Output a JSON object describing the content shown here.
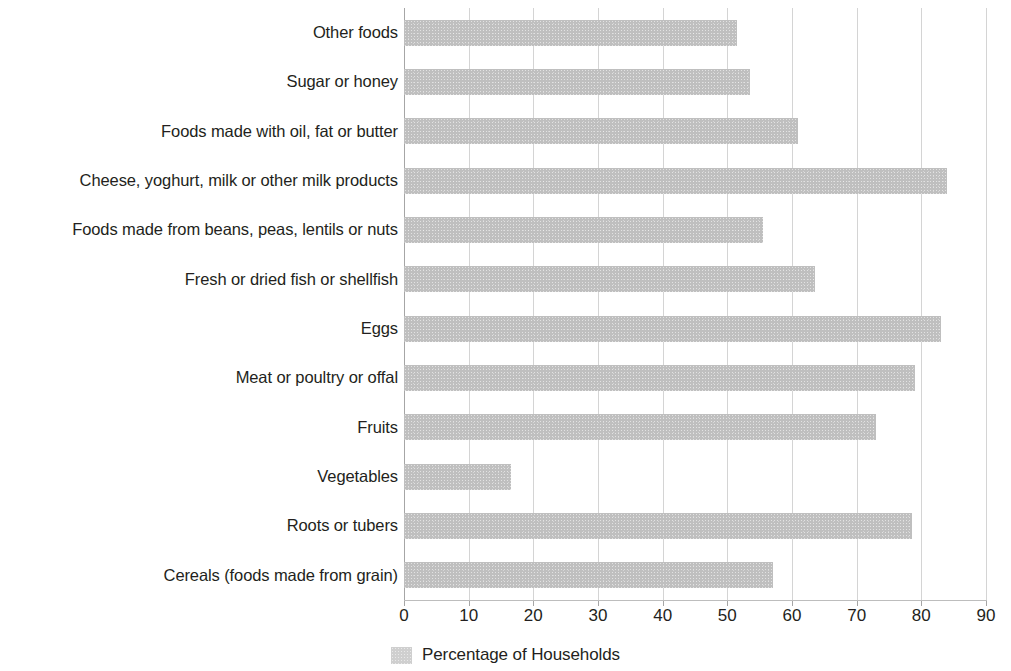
{
  "chart_data": {
    "type": "bar",
    "orientation": "horizontal",
    "title": "",
    "subtitle": "",
    "xlabel": "",
    "ylabel": "",
    "xlim": [
      0,
      90
    ],
    "xticks": [
      0,
      10,
      20,
      30,
      40,
      50,
      60,
      70,
      80,
      90
    ],
    "xtick_labels": [
      "0",
      "10",
      "20",
      "30",
      "40",
      "50",
      "60",
      "70",
      "80",
      "90"
    ],
    "grid": "vertical",
    "legend_position": "bottom-center",
    "legend": [
      "Percentage of Households"
    ],
    "series_name": "Percentage of Households",
    "bar_color": "#bfbfbf",
    "categories": [
      "Other foods",
      "Sugar or honey",
      "Foods made with oil, fat or butter",
      "Cheese, yoghurt, milk or other milk products",
      "Foods made from beans, peas, lentils or nuts",
      "Fresh or dried fish or shellfish",
      "Eggs",
      "Meat or poultry or offal",
      "Fruits",
      "Vegetables",
      "Roots or tubers",
      "Cereals (foods made from grain)"
    ],
    "values": [
      51.5,
      53.5,
      61,
      84,
      55.5,
      63.5,
      83,
      79,
      73,
      16.5,
      78.5,
      57
    ]
  },
  "legend": {
    "swatch_icon": "legend-swatch-icon",
    "label": "Percentage of Households"
  }
}
